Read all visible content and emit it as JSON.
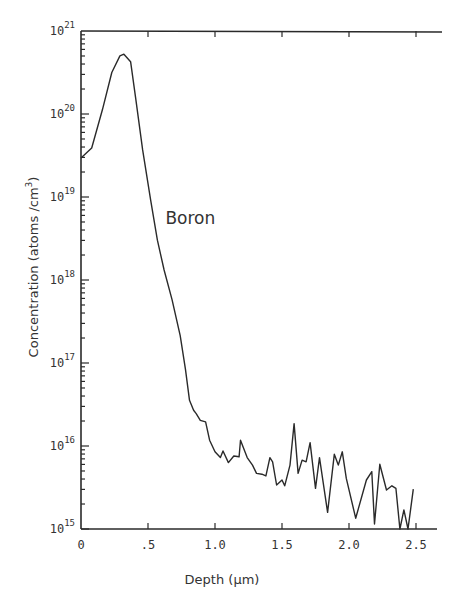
{
  "chart_data": {
    "type": "line",
    "title": "",
    "xlabel": "Depth (µm)",
    "ylabel": "Concentration (atoms /cm³)",
    "yscale": "log",
    "xlim": [
      0,
      2.6
    ],
    "ylim": [
      1000000000000000.0,
      1e+21
    ],
    "grid": false,
    "legend": null,
    "x_ticks": [
      0,
      0.5,
      1.0,
      1.5,
      2.0,
      2.5
    ],
    "x_tick_labels": [
      "0",
      ".5",
      "1.0",
      "1.5",
      "2.0",
      "2.5"
    ],
    "y_ticks": [
      15,
      16,
      17,
      18,
      19,
      20,
      21
    ],
    "y_tick_labels": [
      "10^15",
      "10^16",
      "10^17",
      "10^18",
      "10^19",
      "10^20",
      "10^21"
    ],
    "annotations": [
      {
        "text": "Boron",
        "x": 0.63,
        "y_log10": 18.75
      }
    ],
    "series": [
      {
        "name": "Boron",
        "x": [
          0.0,
          0.08,
          0.16,
          0.23,
          0.29,
          0.32,
          0.37,
          0.41,
          0.46,
          0.52,
          0.57,
          0.62,
          0.68,
          0.74,
          0.78,
          0.81,
          0.84,
          0.86,
          0.89,
          0.93,
          0.96,
          1.0,
          1.04,
          1.06,
          1.1,
          1.14,
          1.18,
          1.19,
          1.24,
          1.28,
          1.31,
          1.35,
          1.38,
          1.41,
          1.43,
          1.46,
          1.5,
          1.52,
          1.56,
          1.59,
          1.62,
          1.65,
          1.68,
          1.71,
          1.75,
          1.78,
          1.84,
          1.89,
          1.92,
          1.95,
          1.98,
          2.05,
          2.13,
          2.17,
          2.19,
          2.23,
          2.28,
          2.32,
          2.35,
          2.38,
          2.41,
          2.44,
          2.48
        ],
        "log10_values": [
          19.47,
          19.59,
          20.05,
          20.5,
          20.7,
          20.72,
          20.63,
          20.17,
          19.57,
          18.96,
          18.48,
          18.12,
          17.76,
          17.33,
          16.92,
          16.55,
          16.43,
          16.39,
          16.31,
          16.29,
          16.07,
          15.93,
          15.86,
          15.94,
          15.8,
          15.88,
          15.87,
          16.07,
          15.86,
          15.77,
          15.67,
          15.66,
          15.64,
          15.86,
          15.81,
          15.53,
          15.59,
          15.52,
          15.77,
          16.27,
          15.67,
          15.83,
          15.81,
          16.04,
          15.49,
          15.86,
          15.2,
          15.9,
          15.77,
          15.93,
          15.61,
          15.13,
          15.59,
          15.69,
          15.06,
          15.78,
          15.47,
          15.52,
          15.49,
          15.0,
          15.23,
          15.0,
          15.48
        ]
      }
    ]
  },
  "labels": {
    "annotation": "Boron",
    "xlabel": "Depth (µm)",
    "ylabel_main": "Concentration (atoms /cm",
    "ylabel_sup": "3",
    "ylabel_close": ")",
    "ybase": "10"
  }
}
